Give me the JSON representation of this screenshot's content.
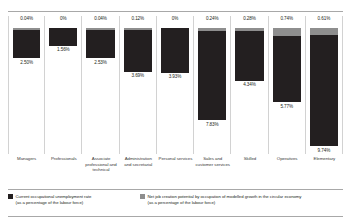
{
  "chart_data": {
    "type": "bar",
    "title": "",
    "subtitle": "",
    "xlabel": "",
    "ylabel": "",
    "grid": false,
    "stacked": true,
    "orientation": "vertical-downward",
    "legend_position": "bottom",
    "categories": [
      "Managers",
      "Professionals",
      "Associate professional and technical",
      "Administration and secretarial",
      "Personal services",
      "Sales and customer services",
      "Skilled",
      "Operatives",
      "Elementary"
    ],
    "series": [
      {
        "name": "Current occupational unemployment rate (as a percentage of the labour force)",
        "color": "#231f20",
        "values": [
          2.5,
          1.56,
          2.53,
          3.69,
          3.93,
          7.83,
          4.34,
          5.77,
          9.74
        ],
        "value_labels": [
          "2.50%",
          "1.56%",
          "2.53%",
          "3.69%",
          "3.93%",
          "7.83%",
          "4.34%",
          "5.77%",
          "9.74%"
        ]
      },
      {
        "name": "Net job creation potential by occupation of modelled growth in the circular economy (as a percentage of the labour force)",
        "color": "#8e8e8e",
        "values": [
          0.04,
          0.0,
          0.04,
          0.12,
          0.0,
          0.24,
          0.28,
          0.74,
          0.61
        ],
        "value_labels": [
          "0.04%",
          "0%",
          "0.04%",
          "0.12%",
          "0%",
          "0.24%",
          "0.28%",
          "0.74%",
          "0.61%"
        ]
      }
    ],
    "ylim": [
      0,
      10.35
    ]
  },
  "legend": {
    "items": [
      {
        "line1": "Current occupational unemployment rate",
        "line2": "(as a percentage of the labour force)",
        "color": "#231f20"
      },
      {
        "line1": "Net job creation potential by occupation of modelled growth in the circular economy",
        "line2": "(as a percentage of the labour force)",
        "color": "#8e8e8e"
      }
    ]
  }
}
